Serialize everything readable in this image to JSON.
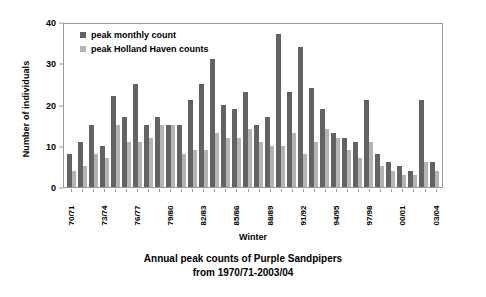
{
  "chart_data": {
    "type": "bar",
    "title": "Annual peak counts of Purple Sandpipers",
    "subtitle": "from 1970/71-2003/04",
    "xlabel": "Winter",
    "ylabel": "Number of individuals",
    "ylim": [
      0,
      40
    ],
    "yticks": [
      0,
      10,
      20,
      30,
      40
    ],
    "grid": false,
    "legend_position": "top-left",
    "colors": {
      "peak_monthly_count": "#636363",
      "peak_holland_haven_counts": "#b4b4b4"
    },
    "categories": [
      "70/71",
      "71/72",
      "72/73",
      "73/74",
      "74/75",
      "75/76",
      "76/77",
      "77/78",
      "78/79",
      "79/80",
      "80/81",
      "81/82",
      "82/83",
      "83/84",
      "84/85",
      "85/86",
      "86/87",
      "87/88",
      "88/89",
      "89/90",
      "90/91",
      "91/92",
      "92/93",
      "93/94",
      "94/95",
      "95/96",
      "96/97",
      "97/98",
      "98/99",
      "99/00",
      "00/01",
      "01/02",
      "02/03",
      "03/04"
    ],
    "xtick_labels_shown": [
      "70/71",
      "73/74",
      "76/77",
      "79/80",
      "82/83",
      "85/86",
      "88/89",
      "91/92",
      "94/95",
      "97/98",
      "00/01",
      "03/04"
    ],
    "series": [
      {
        "name": "peak monthly count",
        "color": "#636363",
        "values": [
          8,
          11,
          15,
          10,
          22,
          17,
          25,
          15,
          17,
          15,
          15,
          21,
          25,
          31,
          20,
          19,
          23,
          15,
          17,
          37,
          23,
          34,
          24,
          19,
          13,
          12,
          11,
          21,
          8,
          6,
          5,
          4,
          21,
          6
        ]
      },
      {
        "name": "peak Holland Haven counts",
        "color": "#b4b4b4",
        "values": [
          4,
          5,
          8,
          7,
          15,
          11,
          11,
          12,
          15,
          15,
          8,
          9,
          9,
          13,
          12,
          12,
          14,
          11,
          10,
          10,
          13,
          8,
          11,
          14,
          12,
          9,
          7,
          11,
          5,
          4,
          3,
          3,
          6,
          4
        ]
      }
    ]
  },
  "legend": {
    "items": [
      {
        "label": "peak monthly count",
        "swatch": "dark"
      },
      {
        "label": "peak Holland Haven counts",
        "swatch": "light"
      }
    ]
  }
}
